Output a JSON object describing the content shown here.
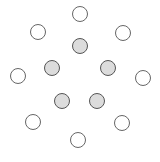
{
  "figure": {
    "background_color": "#ffffff",
    "width": 160,
    "height": 162
  },
  "style": {
    "outer_fill": "#ffffff",
    "outer_stroke": "#666666",
    "inner_fill": "#dcdcdc",
    "inner_stroke": "#555555",
    "stroke_width": 1
  },
  "chart_data": {
    "type": "scatter",
    "title": "",
    "xlabel": "",
    "ylabel": "",
    "xlim": [
      0,
      160
    ],
    "ylim": [
      0,
      162
    ],
    "grid": false,
    "legend": "none",
    "marker": "circle",
    "series": [
      {
        "name": "unshaded-nodes",
        "fill": "#ffffff",
        "stroke": "#666666",
        "radius": 7.5,
        "points": [
          {
            "id": "n1",
            "x": 80,
            "y": 14
          },
          {
            "id": "n2",
            "x": 38,
            "y": 32
          },
          {
            "id": "n3",
            "x": 123,
            "y": 33
          },
          {
            "id": "n4",
            "x": 18,
            "y": 76
          },
          {
            "id": "n5",
            "x": 143,
            "y": 78
          },
          {
            "id": "n6",
            "x": 33,
            "y": 122
          },
          {
            "id": "n7",
            "x": 122,
            "y": 123
          },
          {
            "id": "n8",
            "x": 78,
            "y": 140
          }
        ]
      },
      {
        "name": "shaded-nodes",
        "fill": "#dcdcdc",
        "stroke": "#555555",
        "radius": 7.5,
        "points": [
          {
            "id": "s1",
            "x": 80,
            "y": 46
          },
          {
            "id": "s2",
            "x": 52,
            "y": 68
          },
          {
            "id": "s3",
            "x": 108,
            "y": 68
          },
          {
            "id": "s4",
            "x": 62,
            "y": 101
          },
          {
            "id": "s5",
            "x": 97,
            "y": 101
          }
        ]
      }
    ]
  }
}
